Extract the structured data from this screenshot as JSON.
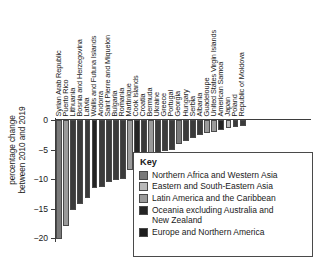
{
  "chart_data": {
    "type": "bar",
    "title": "",
    "subtitle": "",
    "xlabel": "",
    "ylabel": "percentage change\nbetween 2010 and 2019",
    "ylim": [
      -20.5,
      0
    ],
    "yticks": [
      0,
      -5,
      -10,
      -15,
      -20
    ],
    "ytick_labels": [
      "0",
      "−5",
      "−10",
      "−15",
      "−20"
    ],
    "grid": false,
    "legend_position": "inside-bottom-right",
    "orientation": "vertical",
    "categories": [
      "Syrian Arab Republic",
      "Puerto Rico",
      "Lithuania",
      "Bosnia and Herzegovina",
      "Latvia",
      "Wallis and Futuna Islands",
      "Andorra",
      "Saint Pierre and Miquelon",
      "Bulgaria",
      "Romania",
      "Martinique",
      "Cook Islands",
      "Croatia",
      "Bermuda",
      "Ukraine",
      "Greece",
      "Portugal",
      "Georgia",
      "Hungary",
      "Serbia",
      "Albania",
      "Guadeloupe",
      "United States Virgin Islands",
      "American Samoa",
      "Japan",
      "Poland",
      "Republic of Moldova"
    ],
    "values": [
      -20.1,
      -18.0,
      -15.2,
      -14.2,
      -13.2,
      -11.5,
      -11.3,
      -10.5,
      -10.2,
      -10.0,
      -8.4,
      -7.2,
      -6.5,
      -6.0,
      -5.6,
      -5.3,
      -5.0,
      -4.0,
      -3.5,
      -3.0,
      -2.6,
      -2.2,
      -2.0,
      -1.7,
      -1.4,
      -1.2,
      -1.0
    ],
    "group_of_category": [
      "northern-africa-western-asia",
      "latin-america-caribbean",
      "europe-northern-america",
      "europe-northern-america",
      "europe-northern-america",
      "oceania-excluding",
      "europe-northern-america",
      "europe-northern-america",
      "europe-northern-america",
      "europe-northern-america",
      "latin-america-caribbean",
      "oceania-excluding",
      "europe-northern-america",
      "latin-america-caribbean",
      "europe-northern-america",
      "europe-northern-america",
      "europe-northern-america",
      "northern-africa-western-asia",
      "europe-northern-america",
      "europe-northern-america",
      "europe-northern-america",
      "latin-america-caribbean",
      "latin-america-caribbean",
      "oceania-excluding",
      "eastern-south-eastern-asia",
      "europe-northern-america",
      "europe-northern-america"
    ],
    "series": [
      {
        "name": "Northern Africa and Western Asia",
        "key": "northern-africa-western-asia",
        "color": "#7a7a7a"
      },
      {
        "name": "Eastern and South-Eastern Asia",
        "key": "eastern-south-eastern-asia",
        "color": "#b9b9b9"
      },
      {
        "name": "Latin America and the Caribbean",
        "key": "latin-america-caribbean",
        "color": "#9a9a9a"
      },
      {
        "name": "Oceania excluding Australia and New Zealand",
        "key": "oceania-excluding",
        "color": "#242424"
      },
      {
        "name": "Europe and Northern America",
        "key": "europe-northern-america",
        "color": "#3b3b3b"
      }
    ]
  },
  "legend": {
    "title": "Key",
    "entries": [
      {
        "label": "Northern Africa and Western Asia",
        "color": "#7a7a7a"
      },
      {
        "label": "Eastern and South-Eastern Asia",
        "color": "#b9b9b9"
      },
      {
        "label": "Latin America and the Caribbean",
        "color": "#9a9a9a"
      },
      {
        "label": "Oceania excluding Australia and\nNew Zealand",
        "color": "#242424"
      },
      {
        "label": "Europe and Northern America",
        "color": "#1d1d1d"
      }
    ]
  },
  "axis": {
    "y_title": "percentage change\nbetween 2010 and 2019"
  }
}
